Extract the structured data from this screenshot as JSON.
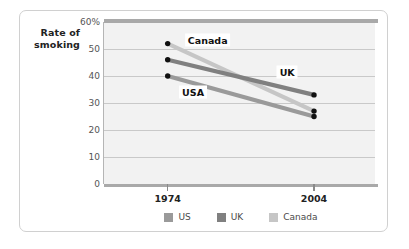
{
  "chart_data": {
    "type": "line",
    "title": "",
    "subtitle": "",
    "xlabel": "",
    "ylabel": "Rate of smoking",
    "ylabel_lines": [
      "Rate of",
      "smoking"
    ],
    "x": [
      "1974",
      "2004"
    ],
    "categories": [
      "1974",
      "2004"
    ],
    "xlim": [
      1974,
      2004
    ],
    "ylim": [
      0,
      60
    ],
    "grid": true,
    "legend_position": "bottom",
    "y_ticks": [
      {
        "value": 60,
        "label": "60%"
      },
      {
        "value": 50,
        "label": "50"
      },
      {
        "value": 40,
        "label": "40"
      },
      {
        "value": 30,
        "label": "30"
      },
      {
        "value": 20,
        "label": "20"
      },
      {
        "value": 10,
        "label": "10"
      },
      {
        "value": 0,
        "label": "0"
      }
    ],
    "x_ticks": [
      {
        "value": 1974,
        "label": "1974"
      },
      {
        "value": 2004,
        "label": "2004"
      }
    ],
    "series": [
      {
        "name": "US",
        "legend_label": "US",
        "annotation": "USA",
        "color": "#9a9a9a",
        "values": [
          40,
          25
        ],
        "marker_color": "#111111"
      },
      {
        "name": "UK",
        "legend_label": "UK",
        "annotation": "UK",
        "color": "#808080",
        "values": [
          46,
          33
        ],
        "marker_color": "#111111"
      },
      {
        "name": "Canada",
        "legend_label": "Canada",
        "annotation": "Canada",
        "color": "#c6c6c6",
        "values": [
          52,
          27
        ],
        "marker_color": "#111111"
      }
    ],
    "annotations": [
      {
        "text": "Canada",
        "x": 1982.2,
        "y": 53.5
      },
      {
        "text": "UK",
        "x": 1998.5,
        "y": 41.5
      },
      {
        "text": "USA",
        "x": 1979.2,
        "y": 34.0
      }
    ],
    "colors": {
      "plot_background": "#f2f2f2",
      "gridline": "#c9c9c9",
      "axis": "#a9a9a9",
      "frame": "#d0d0d0",
      "text": "#222222",
      "tick_text": "#555555"
    }
  },
  "legend": {
    "entries": [
      {
        "label": "US",
        "color": "#9a9a9a"
      },
      {
        "label": "UK",
        "color": "#808080"
      },
      {
        "label": "Canada",
        "color": "#c6c6c6"
      }
    ]
  }
}
